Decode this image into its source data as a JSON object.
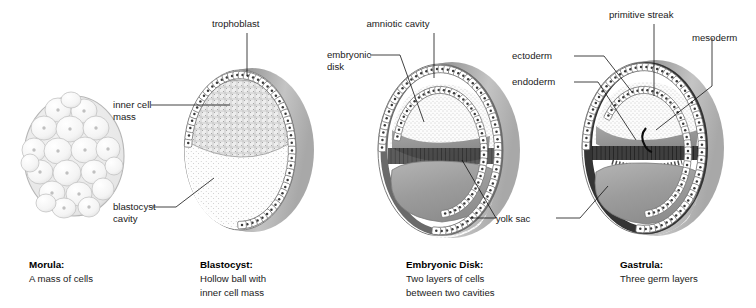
{
  "figure": {
    "style": "grayscale scientific illustration",
    "background_color": "#ffffff",
    "ink_color": "#1a1a1a"
  },
  "palette": {
    "shell_dark": "#8a8a8a",
    "shell_light": "#d0d0d0",
    "cell_fill": "#ffffff",
    "cell_outline": "#6f6f6f",
    "nucleus": "#3a3a3a",
    "cavity_stipple": "#fafafa",
    "yolk_sac": "#9a9a9a",
    "amnion_gray": "#8f8f8f",
    "ectoderm_dark": "#3c3c3c",
    "inner_mass": "#e8e8e8"
  },
  "panels": [
    {
      "id": "morula",
      "caption_title": "Morula:",
      "caption_body": "A mass of cells",
      "labels": []
    },
    {
      "id": "blastocyst",
      "caption_title": "Blastocyst:",
      "caption_body_lines": [
        "Hollow ball with",
        "inner cell mass"
      ],
      "labels": [
        {
          "id": "trophoblast",
          "text": "trophoblast",
          "anchor": "top"
        },
        {
          "id": "inner-cell-mass",
          "text_lines": [
            "inner cell",
            "mass"
          ],
          "anchor": "left"
        },
        {
          "id": "blastocyst-cavity",
          "text_lines": [
            "blastocyst",
            "cavity"
          ],
          "anchor": "left"
        }
      ]
    },
    {
      "id": "embryonic-disk",
      "caption_title": "Embryonic Disk:",
      "caption_body_lines": [
        "Two layers of cells",
        "between two cavities"
      ],
      "labels": [
        {
          "id": "amniotic-cavity",
          "text": "amniotic cavity",
          "anchor": "top"
        },
        {
          "id": "embryonic-disk",
          "text_lines": [
            "embryonic",
            "disk"
          ],
          "anchor": "left"
        },
        {
          "id": "yolk-sac",
          "text": "yolk sac",
          "anchor": "bottom"
        }
      ]
    },
    {
      "id": "gastrula",
      "caption_title": "Gastrula:",
      "caption_body": "Three germ layers",
      "labels": [
        {
          "id": "primitive-streak",
          "text": "primitive streak",
          "anchor": "top"
        },
        {
          "id": "mesoderm",
          "text": "mesoderm",
          "anchor": "right"
        },
        {
          "id": "ectoderm",
          "text": "ectoderm",
          "anchor": "left"
        },
        {
          "id": "endoderm",
          "text": "endoderm",
          "anchor": "left"
        }
      ]
    }
  ],
  "labels_flat": {
    "trophoblast": "trophoblast",
    "inner_cell_1": "inner cell",
    "inner_cell_2": "mass",
    "blastocyst_cavity_1": "blastocyst",
    "blastocyst_cavity_2": "cavity",
    "amniotic_cavity": "amniotic cavity",
    "embryonic_disk_1": "embryonic",
    "embryonic_disk_2": "disk",
    "yolk_sac": "yolk sac",
    "primitive_streak": "primitive streak",
    "mesoderm": "mesoderm",
    "ectoderm": "ectoderm",
    "endoderm": "endoderm"
  },
  "captions": {
    "morula_title": "Morula:",
    "morula_l1": "A mass of cells",
    "blastocyst_title": "Blastocyst:",
    "blastocyst_l1": "Hollow ball with",
    "blastocyst_l2": "inner cell mass",
    "embryonic_title": "Embryonic Disk:",
    "embryonic_l1": "Two layers of cells",
    "embryonic_l2": "between two cavities",
    "gastrula_title": "Gastrula:",
    "gastrula_l1": "Three germ layers"
  }
}
